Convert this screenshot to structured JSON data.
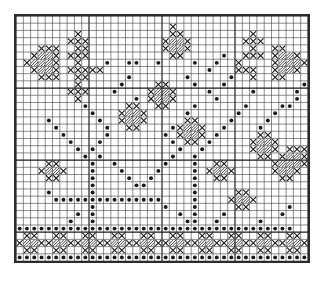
{
  "document": {
    "title": "Cross-Stitch Pattern Chart",
    "type": "needlework-grid-chart",
    "description": "Monochrome counted cross-stitch / filet crochet pattern grid with floral and star motifs and a decorative lower border."
  },
  "grid": {
    "columns": 40,
    "rows": 34,
    "cell_px": 7.4,
    "minor_line_color": "#3a3a3a",
    "major_line_color": "#1a1a1a",
    "major_line_every": 10,
    "background_color": "#ffffff",
    "border_color": "#2b2b2b",
    "symbol_color": "#1a1a1a"
  },
  "legend": {
    "symbols": [
      {
        "key": "x",
        "name": "cross-stitch-symbol",
        "glyph": "X",
        "label": "X"
      },
      {
        "key": "d",
        "name": "filled-dot-symbol",
        "glyph": "●",
        "label": "dot"
      },
      {
        "key": "s",
        "name": "diagonal-fill-symbol",
        "glyph": "╱",
        "label": "diagonal"
      }
    ]
  },
  "chart_data": {
    "type": "heatmap",
    "xlabel": "",
    "ylabel": "",
    "grid": true,
    "legend_position": "none",
    "ncols": 40,
    "nrows": 34,
    "symbol_key": {
      "0": "empty",
      "x": "cross",
      "d": "dot",
      "s": "diagonal"
    },
    "cells": [
      "........................................",
      ".....................x..................",
      "........x............xx.........x.......",
      ".......xxx..........xssx.......xxx......",
      "...xxx..xx..........xssx........x..xx...",
      "..xssx.xxx...........xx.....d..xxx.xssx.",
      ".xsssx..x...d..dd..d....d..d..x....xsssx",
      "..xssx.xxxxx..............d...xxx..xssx.",
      "...xxx..xx.....d.......d.....d..x..xx...",
      "........x.....d....xx...d...d..........d",
      ".......xxx...d....xssx....d.....d.....d.",
      "........x.......d.xssx.....d..........d.",
      ".........d.....xx..xx...d......d....dd..",
      "..........d...xssx.....d......d....d....",
      "....d......d..xssx.....xx....d....d.....",
      ".....d......d..xx....dxssx..d....d......",
      "......d.....d.......d.xssx.d.....xx.....",
      ".......d...d.........d.xx.d.....xssx....",
      "........d.d...........d..d......xssx.xxx",
      ".........d.d.........d..d........xx.xssx",
      "....xx....d..d......d...d..xx......xsssx",
      "...xssx...d...d....d....d.xssx.....xssx.",
      "....xx....d....d..d.....d..xx.......xx..",
      "..........d.....dd......d...............",
      "....d.....d.............d.....xx........",
      ".....ddddddddddddddd....d....xssx.......",
      "..........d.........d...d.....xx.....d..",
      "........d.d...........d.d...d.......d...",
      ".......d..d............dd..d.....d......",
      "dddddddddddddddddddddddddddddddddddddd..",
      ".xx..xx..xx..xx..xx..xx..xx..xx..xx..xx.",
      "xssxxssxxssxxssxxssxxssxxssxxssxxssxxssx",
      ".xx..xx..xx..xx..xx..xx..xx..xx..xx..xx.",
      "dddddddddddddddddddddddddddddddddddddddd"
    ]
  }
}
